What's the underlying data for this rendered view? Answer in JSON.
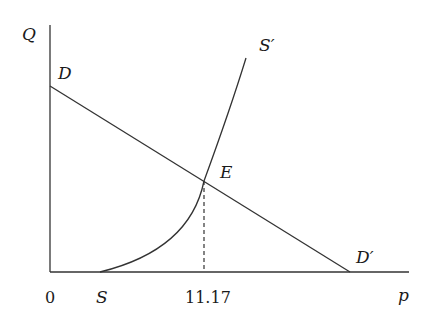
{
  "diagram": {
    "type": "supply-demand",
    "axes": {
      "y_label": "Q",
      "x_label": "p",
      "origin_label": "0"
    },
    "curves": {
      "demand": {
        "start_label": "D",
        "end_label": "D′"
      },
      "supply": {
        "start_label": "S",
        "end_label": "S′"
      }
    },
    "equilibrium": {
      "label": "E",
      "price_tick": "11.17"
    },
    "colors": {
      "line": "#333333",
      "text": "#1a1a1a",
      "background": "#ffffff"
    }
  }
}
